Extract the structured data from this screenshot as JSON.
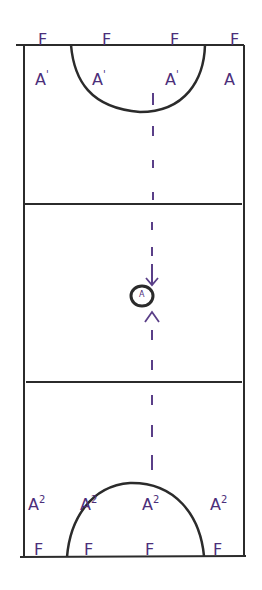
{
  "diagram": {
    "type": "netball-court",
    "colors": {
      "lines": "#2b2b2b",
      "labels": "#4b2e7a",
      "dashes": "#5a3f88"
    },
    "top_row_F": [
      {
        "label": "F",
        "x": 38,
        "y": 32
      },
      {
        "label": "F",
        "x": 102,
        "y": 32
      },
      {
        "label": "F",
        "x": 170,
        "y": 32
      },
      {
        "label": "F",
        "x": 230,
        "y": 32
      }
    ],
    "top_row_A": [
      {
        "label": "A",
        "sup": "'",
        "x": 35,
        "y": 72
      },
      {
        "label": "A",
        "sup": "'",
        "x": 92,
        "y": 72
      },
      {
        "label": "A",
        "sup": "'",
        "x": 165,
        "y": 72
      },
      {
        "label": "A",
        "sup": "",
        "x": 224,
        "y": 72
      }
    ],
    "bottom_row_A": [
      {
        "label": "A",
        "sup": "2",
        "x": 28,
        "y": 497
      },
      {
        "label": "A",
        "sup": "2",
        "x": 80,
        "y": 497
      },
      {
        "label": "A",
        "sup": "2",
        "x": 142,
        "y": 497
      },
      {
        "label": "A",
        "sup": "2",
        "x": 210,
        "y": 497
      }
    ],
    "bottom_row_F": [
      {
        "label": "F",
        "x": 34,
        "y": 542
      },
      {
        "label": "F",
        "x": 84,
        "y": 542
      },
      {
        "label": "F",
        "x": 145,
        "y": 542
      },
      {
        "label": "F",
        "x": 213,
        "y": 542
      }
    ],
    "center_circle_label": "A"
  }
}
